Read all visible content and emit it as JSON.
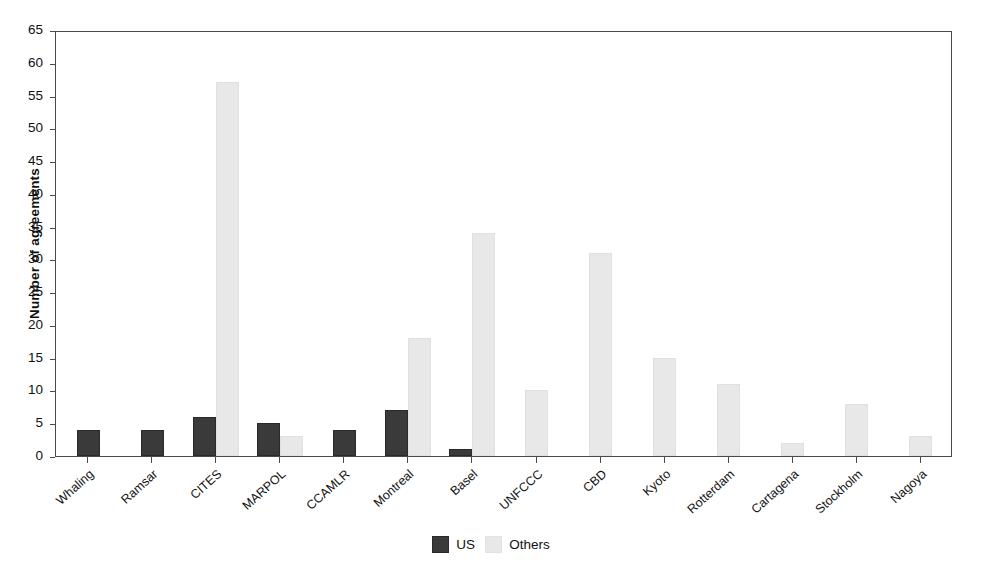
{
  "chart_data": {
    "type": "bar",
    "title": "",
    "xlabel": "",
    "ylabel": "Number of agreements",
    "ylim": [
      0,
      65
    ],
    "ytick_step": 5,
    "yticks": [
      0,
      5,
      10,
      15,
      20,
      25,
      30,
      35,
      40,
      45,
      50,
      55,
      60,
      65
    ],
    "grid": false,
    "legend_position": "bottom-center",
    "categories": [
      "Whaling",
      "Ramsar",
      "CITES",
      "MARPOL",
      "CCAMLR",
      "Montreal",
      "Basel",
      "UNFCCC",
      "CBD",
      "Kyoto",
      "Rotterdam",
      "Cartagena",
      "Stockholm",
      "Nagoya"
    ],
    "series": [
      {
        "name": "US",
        "color": "#3a3a3a",
        "values": [
          4,
          4,
          6,
          5,
          4,
          7,
          1,
          0,
          0,
          0,
          0,
          0,
          0,
          0
        ]
      },
      {
        "name": "Others",
        "color": "#e8e8e8",
        "values": [
          0,
          0,
          57,
          3,
          0,
          18,
          34,
          10,
          31,
          15,
          11,
          2,
          8,
          3
        ]
      }
    ]
  },
  "legend": {
    "items": [
      {
        "label": "US",
        "swatch": "us"
      },
      {
        "label": "Others",
        "swatch": "others"
      }
    ]
  },
  "colors": {
    "us": "#3a3a3a",
    "others": "#e8e8e8",
    "axis": "#4a4a4a",
    "background": "#ffffff"
  }
}
